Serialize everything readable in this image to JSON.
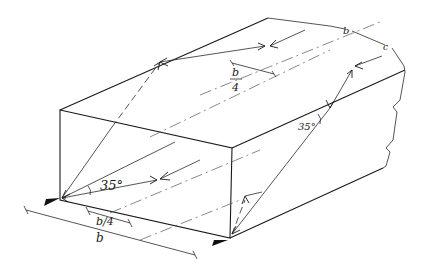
{
  "figure": {
    "kind": "isometric sketch of rectangular duct with ray reflection paths",
    "labels": {
      "angle_front": "35°",
      "angle_right": "35°",
      "offset_top_num": "b",
      "offset_top_den": "4",
      "offset_bottom": "b/4",
      "width": "b",
      "break_label_1": "b",
      "break_label_2": "c"
    },
    "colors": {
      "ink": "#1a1a1a",
      "paper": "#ffffff"
    }
  }
}
